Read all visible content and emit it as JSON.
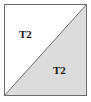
{
  "figure": {
    "name": "split-square-diagram",
    "canvas": {
      "width": 91,
      "height": 102
    },
    "frame": {
      "x": 4,
      "y": 4,
      "width": 83,
      "height": 92,
      "border_color": "#6b6b6b",
      "border_width": 1
    },
    "diagonal": {
      "from": "bottom-left",
      "to": "top-right",
      "x1": 4,
      "y1": 96,
      "x2": 87,
      "y2": 4,
      "color": "#6b6b6b",
      "width": 1
    },
    "regions": [
      {
        "id": "upper-left",
        "label": "T2",
        "fill": "#ffffff",
        "vertices": "top-left, top-right, bottom-left"
      },
      {
        "id": "lower-right",
        "label": "T2",
        "fill": "#dcdcdc",
        "vertices": "top-right, bottom-right, bottom-left"
      }
    ],
    "colors": {
      "background": "#ffffff",
      "shaded_fill": "#dcdcdc",
      "unshaded_fill": "#ffffff",
      "line": "#6b6b6b",
      "text": "#1a1a1a"
    }
  }
}
